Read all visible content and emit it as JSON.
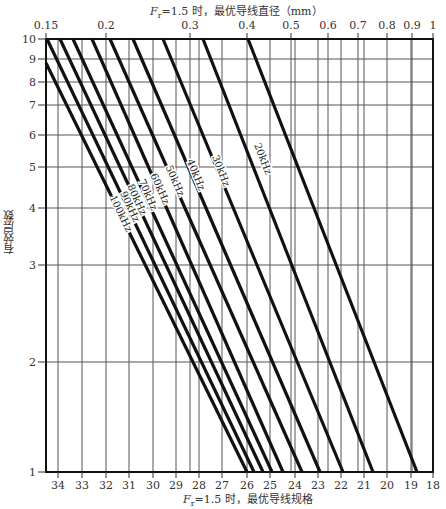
{
  "chart_data": {
    "type": "line",
    "title_top": "Fr=1.5 时，最优导线直径（mm）",
    "xlabel_bottom": "Fr=1.5 时，最优导线规格",
    "ylabel": "有效层数",
    "y_scale": "log",
    "ylim": [
      1,
      10
    ],
    "y_ticks": [
      1,
      2,
      3,
      4,
      5,
      6,
      7,
      8,
      9,
      10
    ],
    "x_top_scale": "log",
    "x_top_ticks": [
      "0.15",
      "0.2",
      "0.3",
      "0.4",
      "0.5",
      "0.6",
      "0.7",
      "0.8",
      "0.9",
      "1"
    ],
    "x_bottom_ticks": [
      "34",
      "33",
      "32",
      "31",
      "30",
      "29",
      "28",
      "27",
      "26",
      "25",
      "24",
      "23",
      "22",
      "21",
      "20",
      "19",
      "18"
    ],
    "grid": true,
    "series": [
      {
        "name": "",
        "points": [
          {
            "d": 0.15,
            "layers": 8.9
          },
          {
            "d": 0.4,
            "layers": 1
          }
        ]
      },
      {
        "name": "100kHz",
        "points": [
          {
            "d": 0.15,
            "layers": 10
          },
          {
            "d": 0.41,
            "layers": 1
          }
        ]
      },
      {
        "name": "90kHz",
        "points": [
          {
            "d": 0.16,
            "layers": 10
          },
          {
            "d": 0.42,
            "layers": 1
          }
        ]
      },
      {
        "name": "80kHz",
        "points": [
          {
            "d": 0.17,
            "layers": 10
          },
          {
            "d": 0.43,
            "layers": 1
          }
        ]
      },
      {
        "name": "70kHz",
        "points": [
          {
            "d": 0.18,
            "layers": 10
          },
          {
            "d": 0.45,
            "layers": 1
          }
        ]
      },
      {
        "name": "60kHz",
        "points": [
          {
            "d": 0.195,
            "layers": 10
          },
          {
            "d": 0.48,
            "layers": 1
          }
        ]
      },
      {
        "name": "50kHz",
        "points": [
          {
            "d": 0.215,
            "layers": 10
          },
          {
            "d": 0.52,
            "layers": 1
          }
        ]
      },
      {
        "name": "40kHz",
        "points": [
          {
            "d": 0.245,
            "layers": 10
          },
          {
            "d": 0.57,
            "layers": 1
          }
        ]
      },
      {
        "name": "30kHz",
        "points": [
          {
            "d": 0.29,
            "layers": 10
          },
          {
            "d": 0.65,
            "layers": 1
          }
        ]
      },
      {
        "name": "20kHz",
        "points": [
          {
            "d": 0.34,
            "layers": 10
          },
          {
            "d": 0.83,
            "layers": 1
          }
        ]
      }
    ]
  },
  "labels": {
    "top_title_main": "F",
    "top_title_sub": "r",
    "top_title_rest": "=1.5 时，最优导线直径（mm）",
    "bottom_title_main": "F",
    "bottom_title_sub": "r",
    "bottom_title_rest": "=1.5 时，最优导线规格",
    "ylabel": "有效层数"
  },
  "layout": {
    "plot": {
      "left": 46,
      "right": 433,
      "top": 39,
      "bottom": 472
    },
    "top_tick_px": [
      46,
      106,
      190,
      247,
      291,
      328,
      358,
      387,
      412,
      433
    ],
    "bottom_tick_px": [
      58,
      82,
      106,
      129,
      153,
      176,
      199,
      222,
      247,
      270,
      295,
      318,
      341,
      364,
      387,
      411,
      433
    ],
    "y_tick_px": [
      472,
      362,
      265,
      208,
      167,
      135,
      105,
      82,
      59,
      39
    ],
    "lines_px": [
      {
        "x1": 46,
        "y1": 63,
        "x2": 247,
        "y2": 472,
        "label": "",
        "lx": 0,
        "ly": 0
      },
      {
        "x1": 47,
        "y1": 39,
        "x2": 254,
        "y2": 472,
        "label": "100kHz",
        "lx": 118,
        "ly": 215
      },
      {
        "x1": 60,
        "y1": 39,
        "x2": 263,
        "y2": 472,
        "label": "90kHz",
        "lx": 127,
        "ly": 208
      },
      {
        "x1": 73,
        "y1": 39,
        "x2": 272,
        "y2": 472,
        "label": "80kHz",
        "lx": 134,
        "ly": 201
      },
      {
        "x1": 92,
        "y1": 39,
        "x2": 283,
        "y2": 472,
        "label": "70kHz",
        "lx": 145,
        "ly": 196
      },
      {
        "x1": 110,
        "y1": 39,
        "x2": 302,
        "y2": 472,
        "label": "60kHz",
        "lx": 157,
        "ly": 190
      },
      {
        "x1": 133,
        "y1": 39,
        "x2": 320,
        "y2": 472,
        "label": "50kHz",
        "lx": 172,
        "ly": 182
      },
      {
        "x1": 163,
        "y1": 39,
        "x2": 343,
        "y2": 472,
        "label": "40kHz",
        "lx": 193,
        "ly": 176
      },
      {
        "x1": 203,
        "y1": 39,
        "x2": 373,
        "y2": 472,
        "label": "30kHz",
        "lx": 218,
        "ly": 172
      },
      {
        "x1": 248,
        "y1": 39,
        "x2": 417,
        "y2": 472,
        "label": "20kHz",
        "lx": 260,
        "ly": 160
      }
    ]
  }
}
